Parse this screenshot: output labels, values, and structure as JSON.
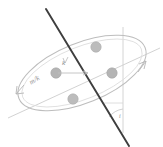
{
  "figure": {
    "kind": "orbital-inclination-diagram",
    "width": 163,
    "height": 147,
    "background": "#ffffff",
    "labels": {
      "mass_ratio": "m/k",
      "vector": "k",
      "angle": "i"
    },
    "colors": {
      "axis_line": "#3a3a3a",
      "ellipse": "#b5b5b5",
      "guide_line": "#c9c9c9",
      "particle_fill": "#b9b9b9",
      "particle_stroke": "#a8a8a8",
      "text": "#8c8c8c",
      "arrow": "#b0b0b0"
    },
    "particles": [
      {
        "name": "particle-upper",
        "cx": 96,
        "cy": 47,
        "r": 5.2
      },
      {
        "name": "particle-right",
        "cx": 112,
        "cy": 73,
        "r": 5.2
      },
      {
        "name": "particle-lower",
        "cx": 73,
        "cy": 99,
        "r": 5.2
      },
      {
        "name": "particle-left",
        "cx": 56,
        "cy": 73,
        "r": 5.2
      }
    ],
    "ellipse": {
      "cx": 82,
      "cy": 73,
      "rx": 68,
      "ry": 30,
      "rotation_deg": -22
    },
    "axis_line": {
      "x1": 46,
      "y1": 9,
      "x2": 129,
      "y2": 146
    },
    "vertical_line": {
      "x1": 123,
      "y1": 28,
      "x2": 123,
      "y2": 131
    },
    "node_line": {
      "x1": 8,
      "y1": 118,
      "x2": 160,
      "y2": 48
    },
    "vector_arrow": {
      "x1": 58,
      "y1": 73,
      "x2": 88,
      "y2": 73
    },
    "rotation_arrows": [
      {
        "name": "rotation-arrow-left",
        "x": 16,
        "y": 93
      },
      {
        "name": "rotation-arrow-right",
        "x": 144,
        "y": 62
      }
    ],
    "angle_arc": {
      "cx": 123,
      "cy": 131,
      "r": 22
    }
  }
}
